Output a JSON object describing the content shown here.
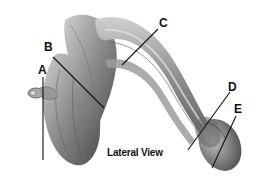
{
  "figure": {
    "caption": "Lateral View",
    "labels": [
      {
        "id": "A",
        "text": "A"
      },
      {
        "id": "B",
        "text": "B"
      },
      {
        "id": "C",
        "text": "C"
      },
      {
        "id": "D",
        "text": "D"
      },
      {
        "id": "E",
        "text": "E"
      }
    ],
    "colors": {
      "background": "#ffffff",
      "tissue_dark": "#5a5a5a",
      "tissue_mid": "#8c8c8c",
      "tissue_light": "#c4c4c4",
      "leader_line": "#111111"
    }
  }
}
